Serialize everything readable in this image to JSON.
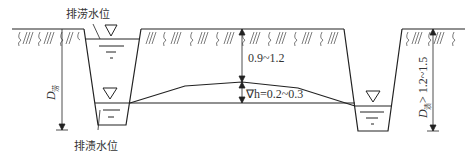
{
  "labels": {
    "drainage_flood_level": "排涝水位",
    "drainage_waterlog_level": "排渍水位",
    "depth_top": "0.9~1.2",
    "delta_h": "∇h=0.2~0.3",
    "d_left_main": "D",
    "d_left_sub": "涝",
    "d_right_main": "D",
    "d_right_sub": "渍",
    "d_right_value": " > 1.2~1.5"
  },
  "colors": {
    "line": "#222222",
    "text": "#333333"
  }
}
